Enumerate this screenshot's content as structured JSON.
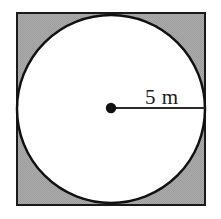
{
  "figure": {
    "name": "square-with-inscribed-circle",
    "canvas": {
      "width": 221,
      "height": 219,
      "background_color": "#ffffff"
    },
    "square": {
      "name": "outer-square",
      "x": 17,
      "y": 13,
      "width": 188,
      "height": 192,
      "fill_color": "#a8a8a8",
      "stroke_color": "#1a1a1a",
      "stroke_width": 2
    },
    "circle": {
      "name": "inscribed-circle",
      "center_x": 111,
      "center_y": 109,
      "radius": 94,
      "fill_color": "#ffffff",
      "stroke_color": "#111111",
      "stroke_width": 2.5
    },
    "center_point": {
      "name": "circle-center-dot",
      "center_x": 111,
      "center_y": 108,
      "radius": 5.2,
      "fill_color": "#111111"
    },
    "radius_line": {
      "name": "radius-segment",
      "x1": 111,
      "y1": 108,
      "x2": 205,
      "y2": 108,
      "stroke_color": "#2a2a2a",
      "stroke_width": 2.2
    },
    "radius_label": {
      "text": "5 m",
      "x": 145,
      "y": 104,
      "font_size": 21,
      "color": "#1a1a1a"
    }
  }
}
